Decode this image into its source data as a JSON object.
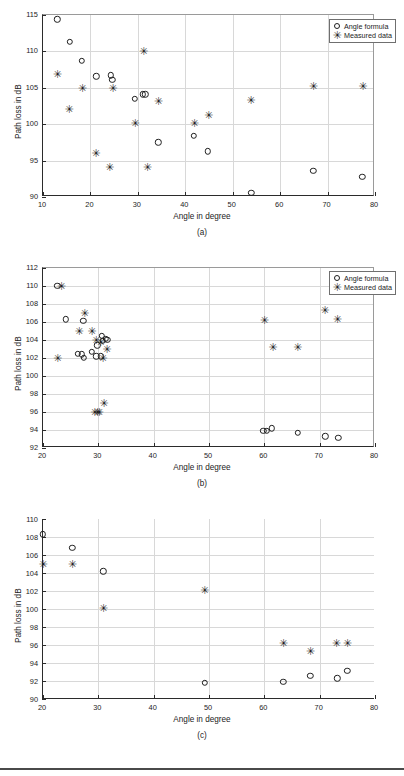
{
  "figure": {
    "panel_count": 3,
    "legend_labels": {
      "formula": "Angle formula",
      "measured": "Measured  data"
    },
    "captions": {
      "a": "(a)",
      "b": "(b)",
      "c": "(c)"
    }
  },
  "chart_data": [
    {
      "id": "a",
      "type": "scatter",
      "title": "",
      "caption": "(a)",
      "xlabel": "Angle in degree",
      "ylabel": "Path loss in dB",
      "xlim": [
        10,
        80
      ],
      "ylim": [
        90,
        115
      ],
      "xticks": [
        10,
        20,
        30,
        40,
        50,
        60,
        70,
        80
      ],
      "yticks": [
        90,
        95,
        100,
        105,
        110,
        115
      ],
      "grid": true,
      "legend_position": "top-right",
      "series": [
        {
          "name": "Angle formula",
          "marker": "circle",
          "points": [
            [
              13.0,
              114.4
            ],
            [
              15.6,
              111.3
            ],
            [
              18.2,
              108.7
            ],
            [
              21.2,
              106.6
            ],
            [
              24.3,
              106.7
            ],
            [
              24.6,
              106.1
            ],
            [
              29.3,
              103.5
            ],
            [
              31.0,
              104.1
            ],
            [
              31.6,
              104.1
            ],
            [
              34.3,
              97.5
            ],
            [
              41.8,
              98.4
            ],
            [
              44.8,
              96.3
            ],
            [
              53.9,
              90.6
            ],
            [
              67.0,
              93.6
            ],
            [
              77.3,
              92.8
            ]
          ]
        },
        {
          "name": "Measured  data",
          "marker": "star",
          "points": [
            [
              13.0,
              106.9
            ],
            [
              15.5,
              102.1
            ],
            [
              18.3,
              105.0
            ],
            [
              21.1,
              96.0
            ],
            [
              24.0,
              94.1
            ],
            [
              24.7,
              105.0
            ],
            [
              29.4,
              100.1
            ],
            [
              31.2,
              110.1
            ],
            [
              32.0,
              94.1
            ],
            [
              34.3,
              103.2
            ],
            [
              41.9,
              100.2
            ],
            [
              44.9,
              101.2
            ],
            [
              53.8,
              103.3
            ],
            [
              67.0,
              105.3
            ],
            [
              77.4,
              105.3
            ]
          ]
        }
      ]
    },
    {
      "id": "b",
      "type": "scatter",
      "title": "",
      "caption": "(b)",
      "xlabel": "Angle in degree",
      "ylabel": "Path loss in dB",
      "xlim": [
        20,
        80
      ],
      "ylim": [
        92,
        112
      ],
      "xticks": [
        20,
        30,
        40,
        50,
        60,
        70,
        80
      ],
      "yticks": [
        92,
        94,
        96,
        98,
        100,
        102,
        104,
        106,
        108,
        110,
        112
      ],
      "grid": true,
      "legend_position": "top-right",
      "series": [
        {
          "name": "Angle formula",
          "marker": "circle",
          "points": [
            [
              22.6,
              110.0
            ],
            [
              24.1,
              106.3
            ],
            [
              27.3,
              106.1
            ],
            [
              26.3,
              102.5
            ],
            [
              27.0,
              102.4
            ],
            [
              27.4,
              102.0
            ],
            [
              28.8,
              102.7
            ],
            [
              29.8,
              103.4
            ],
            [
              30.6,
              104.5
            ],
            [
              30.8,
              103.9
            ],
            [
              31.3,
              104.1
            ],
            [
              31.6,
              104.0
            ],
            [
              29.6,
              102.2
            ],
            [
              30.4,
              102.2
            ],
            [
              59.8,
              93.9
            ],
            [
              60.5,
              93.9
            ],
            [
              61.3,
              94.2
            ],
            [
              66.1,
              93.7
            ],
            [
              71.0,
              93.3
            ],
            [
              73.4,
              93.1
            ]
          ]
        },
        {
          "name": "Measured  data",
          "marker": "star",
          "points": [
            [
              23.3,
              110.0
            ],
            [
              22.6,
              102.0
            ],
            [
              26.5,
              105.0
            ],
            [
              27.5,
              107.0
            ],
            [
              28.8,
              105.0
            ],
            [
              29.6,
              104.0
            ],
            [
              30.4,
              103.8
            ],
            [
              31.5,
              103.0
            ],
            [
              30.8,
              102.0
            ],
            [
              29.3,
              96.0
            ],
            [
              30.1,
              96.0
            ],
            [
              31.0,
              97.0
            ],
            [
              29.8,
              96.0
            ],
            [
              60.0,
              106.2
            ],
            [
              70.9,
              107.3
            ],
            [
              73.2,
              106.3
            ],
            [
              61.5,
              103.2
            ],
            [
              66.0,
              103.2
            ]
          ]
        }
      ]
    },
    {
      "id": "c",
      "type": "scatter",
      "title": "",
      "caption": "(c)",
      "xlabel": "Angle in degree",
      "ylabel": "Path loss in dB",
      "xlim": [
        20,
        80
      ],
      "ylim": [
        90,
        110
      ],
      "xticks": [
        20,
        30,
        40,
        50,
        60,
        70,
        80
      ],
      "yticks": [
        90,
        92,
        94,
        96,
        98,
        100,
        102,
        104,
        106,
        108,
        110
      ],
      "grid": true,
      "legend_position": "none",
      "series": [
        {
          "name": "Angle formula",
          "marker": "circle",
          "points": [
            [
              20.0,
              108.3
            ],
            [
              25.3,
              106.8
            ],
            [
              30.9,
              104.2
            ],
            [
              49.2,
              91.8
            ],
            [
              63.4,
              91.9
            ],
            [
              68.3,
              92.6
            ],
            [
              73.2,
              92.3
            ],
            [
              75.0,
              93.1
            ]
          ]
        },
        {
          "name": "Measured  data",
          "marker": "star",
          "points": [
            [
              20.0,
              105.0
            ],
            [
              25.3,
              105.0
            ],
            [
              30.9,
              100.1
            ],
            [
              49.2,
              102.1
            ],
            [
              63.4,
              96.2
            ],
            [
              68.3,
              95.3
            ],
            [
              73.0,
              96.2
            ],
            [
              75.0,
              96.2
            ]
          ]
        }
      ]
    }
  ]
}
